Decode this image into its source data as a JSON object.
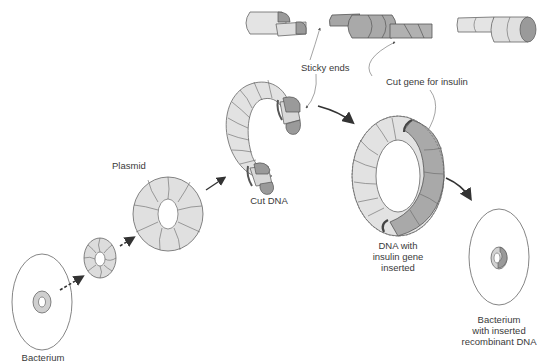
{
  "diagram": {
    "colors": {
      "line": "#555555",
      "light_fill": "#e2e2e2",
      "mid_fill": "#c9c9c9",
      "dark_fill": "#9a9a9a",
      "insert_fill": "#a6a6a6",
      "background": "#ffffff"
    },
    "labels": {
      "bacterium": "Bacterium",
      "plasmid": "Plasmid",
      "cut_dna": "Cut DNA",
      "sticky_ends": "Sticky ends",
      "cut_gene": "Cut gene for insulin",
      "recombinant_line1": "DNA with",
      "recombinant_line2": "insulin gene",
      "recombinant_line3": "inserted",
      "final_line1": "Bacterium",
      "final_line2": "with inserted",
      "final_line3": "recombinant DNA"
    },
    "nodes": [
      {
        "id": "bacterium",
        "label": "Bacterium"
      },
      {
        "id": "plasmid-small",
        "label": ""
      },
      {
        "id": "plasmid",
        "label": "Plasmid"
      },
      {
        "id": "cut-dna",
        "label": "Cut DNA"
      },
      {
        "id": "insulin-gene-segments",
        "label": "Cut gene for insulin"
      },
      {
        "id": "recombinant-dna",
        "label": "DNA with insulin gene inserted"
      },
      {
        "id": "bacterium-recombinant",
        "label": "Bacterium with inserted recombinant DNA"
      }
    ],
    "edges": [
      {
        "from": "bacterium",
        "to": "plasmid-small",
        "style": "dashed-arrow"
      },
      {
        "from": "plasmid-small",
        "to": "plasmid",
        "style": "dashed-arrow"
      },
      {
        "from": "plasmid",
        "to": "cut-dna",
        "style": "arrow"
      },
      {
        "from": "cut-dna",
        "to": "recombinant-dna",
        "style": "curved-arrow"
      },
      {
        "from": "recombinant-dna",
        "to": "bacterium-recombinant",
        "style": "curved-arrow"
      },
      {
        "from": "sticky_ends-label",
        "to": "cut-dna",
        "style": "thin-pointer"
      },
      {
        "from": "cut_gene-label",
        "to": "recombinant-dna",
        "style": "thin-pointer"
      }
    ]
  }
}
